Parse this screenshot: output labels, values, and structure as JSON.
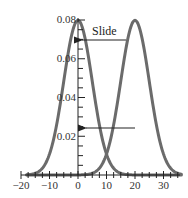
{
  "chart_data": {
    "type": "line",
    "title": "",
    "xlabel": "",
    "ylabel": "",
    "xlim": [
      -20,
      35
    ],
    "ylim": [
      0,
      0.08
    ],
    "grid": false,
    "legend": null,
    "x_ticks": [
      -20,
      -10,
      0,
      10,
      20,
      30
    ],
    "x_tick_labels": [
      "−20",
      "−10",
      "0",
      "10",
      "20",
      "30"
    ],
    "y_ticks": [
      0.02,
      0.04,
      0.06,
      0.08
    ],
    "y_tick_labels": [
      "0.02",
      "0.04",
      "0.06",
      "0.08"
    ],
    "series": [
      {
        "name": "curve-centered-0",
        "kind": "normal-pdf",
        "mean": 0,
        "sd": 5,
        "peak": 0.0798,
        "color": "#6b6b6b"
      },
      {
        "name": "curve-centered-20",
        "kind": "normal-pdf",
        "mean": 20,
        "sd": 5,
        "peak": 0.0798,
        "color": "#6b6b6b"
      }
    ],
    "annotations": [
      {
        "type": "arrow",
        "label": "Slide",
        "from": [
          17,
          0.068
        ],
        "to": [
          0,
          0.068
        ]
      },
      {
        "type": "arrow",
        "label": "",
        "from": [
          20,
          0.024
        ],
        "to": [
          1,
          0.024
        ]
      }
    ]
  },
  "labels": {
    "slide": "Slide",
    "x": [
      "−20",
      "−10",
      "0",
      "10",
      "20",
      "30"
    ],
    "y": [
      "0.02",
      "0.04",
      "0.06",
      "0.08"
    ]
  }
}
